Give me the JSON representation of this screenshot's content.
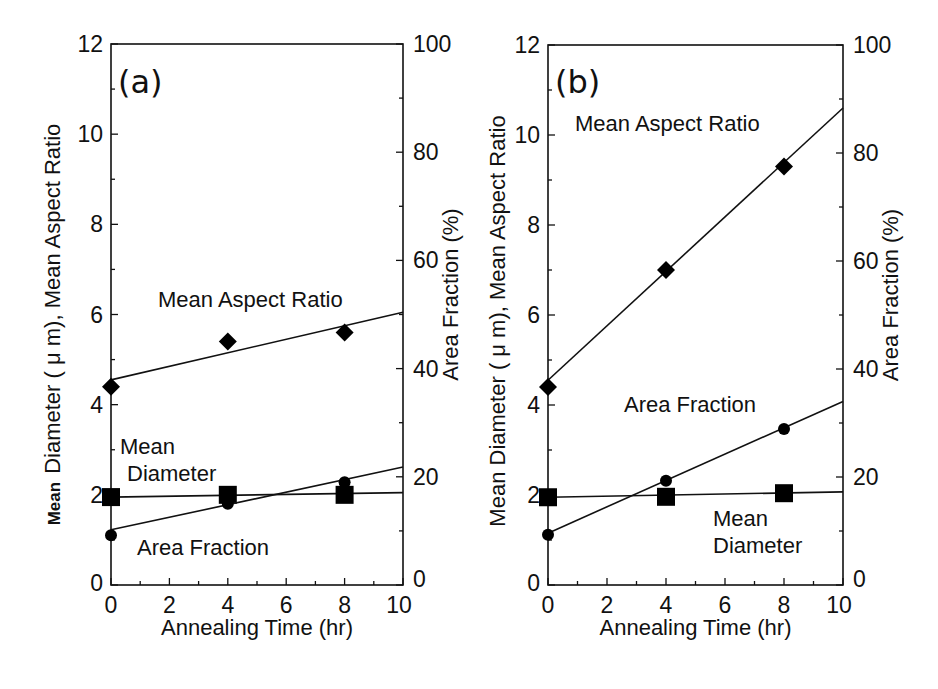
{
  "figure": {
    "panels": [
      {
        "id": "a",
        "panel_label": "(a)",
        "left_axis_title_small": "Mean",
        "left_axis_title": "Diameter ( μ m), Mean Aspect Ratio",
        "right_axis_title": "Area Fraction (%)",
        "x_axis_title": "Annealing Time (hr)",
        "x_ticks": [
          "0",
          "2",
          "4",
          "6",
          "8",
          "10"
        ],
        "left_ticks": [
          "0",
          "2",
          "4",
          "6",
          "8",
          "10",
          "12"
        ],
        "right_ticks": [
          "0",
          "20",
          "40",
          "60",
          "80",
          "100"
        ],
        "annotations": {
          "aspect": "Mean Aspect Ratio",
          "diameter_line1": "Mean",
          "diameter_line2": "Diameter",
          "area": "Area Fraction"
        }
      },
      {
        "id": "b",
        "panel_label": "(b)",
        "left_axis_title": "Mean Diameter ( μ m), Mean Aspect Ratio",
        "right_axis_title": "Area Fraction (%)",
        "x_axis_title": "Annealing Time (hr)",
        "x_ticks": [
          "0",
          "2",
          "4",
          "6",
          "8",
          "10"
        ],
        "left_ticks": [
          "0",
          "2",
          "4",
          "6",
          "8",
          "10",
          "12"
        ],
        "right_ticks": [
          "0",
          "20",
          "40",
          "60",
          "80",
          "100"
        ],
        "annotations": {
          "aspect": "Mean Aspect Ratio",
          "diameter_line1": "Mean",
          "diameter_line2": "Diameter",
          "area": "Area Fraction"
        }
      }
    ]
  },
  "chart_data": [
    {
      "type": "scatter",
      "title": "(a)",
      "xlabel": "Annealing Time (hr)",
      "ylabel": "Mean Diameter (μm), Mean Aspect Ratio",
      "y2label": "Area Fraction (%)",
      "xlim": [
        0,
        10
      ],
      "ylim": [
        0,
        12
      ],
      "y2lim": [
        0,
        100
      ],
      "grid": false,
      "legend": "inline annotations",
      "x": [
        0,
        4,
        8
      ],
      "series": [
        {
          "name": "Mean Aspect Ratio",
          "axis": "left",
          "marker": "diamond",
          "values": [
            4.4,
            5.4,
            5.6
          ],
          "fit_line": {
            "x": [
              0,
              10
            ],
            "y": [
              4.55,
              6.05
            ]
          }
        },
        {
          "name": "Mean Diameter",
          "axis": "left",
          "marker": "square",
          "unit": "μm",
          "values": [
            1.95,
            2.0,
            2.0
          ],
          "fit_line": {
            "x": [
              0,
              10
            ],
            "y": [
              1.95,
              2.05
            ]
          }
        },
        {
          "name": "Area Fraction",
          "axis": "right",
          "marker": "circle",
          "unit": "%",
          "values": [
            9.2,
            15.0,
            19.0
          ],
          "fit_line": {
            "x": [
              0,
              10
            ],
            "y": [
              10.2,
              21.8
            ]
          }
        }
      ]
    },
    {
      "type": "scatter",
      "title": "(b)",
      "xlabel": "Annealing Time (hr)",
      "ylabel": "Mean Diameter (μm), Mean Aspect Ratio",
      "y2label": "Area Fraction (%)",
      "xlim": [
        0,
        10
      ],
      "ylim": [
        0,
        12
      ],
      "y2lim": [
        0,
        100
      ],
      "grid": false,
      "legend": "inline annotations",
      "x": [
        0,
        4,
        8
      ],
      "series": [
        {
          "name": "Mean Aspect Ratio",
          "axis": "left",
          "marker": "diamond",
          "values": [
            4.4,
            7.0,
            9.3
          ],
          "fit_line": {
            "x": [
              0,
              10
            ],
            "y": [
              4.55,
              10.6
            ]
          }
        },
        {
          "name": "Mean Diameter",
          "axis": "left",
          "marker": "square",
          "unit": "μm",
          "values": [
            1.95,
            1.96,
            2.04
          ],
          "fit_line": {
            "x": [
              0,
              10
            ],
            "y": [
              1.95,
              2.07
            ]
          }
        },
        {
          "name": "Area Fraction",
          "axis": "right",
          "marker": "circle",
          "unit": "%",
          "values": [
            9.3,
            19.3,
            28.9
          ],
          "fit_line": {
            "x": [
              0,
              10
            ],
            "y": [
              9.6,
              34.0
            ]
          }
        }
      ]
    }
  ]
}
